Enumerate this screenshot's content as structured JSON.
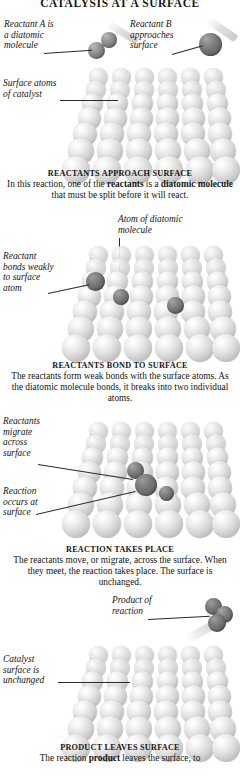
{
  "title": "CATALYSIS AT A SURFACE",
  "panels": [
    {
      "id": "approach",
      "labels": [
        {
          "name": "reactant-a-label",
          "text": "Reactant A is\na diatomic\nmolecule"
        },
        {
          "name": "reactant-b-label",
          "text": "Reactant B\napproaches\nsurface"
        },
        {
          "name": "surface-atoms-label",
          "text": "Surface atoms\nof catalyst"
        }
      ],
      "caption_heading": "REACTANTS APPROACH SURFACE",
      "caption_body_parts": [
        {
          "text": "In this reaction, one of the ",
          "bold": false
        },
        {
          "text": "reactants",
          "bold": true
        },
        {
          "text": " is a ",
          "bold": false
        },
        {
          "text": "diatomic molecule",
          "bold": true
        },
        {
          "text": " that must be split before it will react.",
          "bold": false
        }
      ]
    },
    {
      "id": "bond",
      "labels": [
        {
          "name": "reactant-bonds-weakly-label",
          "text": "Reactant\nbonds weakly\nto surface\natom"
        },
        {
          "name": "atom-of-diatomic-label",
          "text": "Atom of diatomic\nmolecule"
        }
      ],
      "caption_heading": "REACTANTS BOND TO SURFACE",
      "caption_body_parts": [
        {
          "text": "The reactants form weak bonds with the surface atoms. As the diatomic molecule bonds, it breaks into two individual atoms.",
          "bold": false
        }
      ]
    },
    {
      "id": "reaction",
      "labels": [
        {
          "name": "reactants-migrate-label",
          "text": "Reactants\nmigrate\nacross\nsurface"
        },
        {
          "name": "reaction-occurs-label",
          "text": "Reaction\noccurs at\nsurface"
        }
      ],
      "caption_heading": "REACTION TAKES PLACE",
      "caption_body_parts": [
        {
          "text": "The reactants move, or migrate, across the surface. When they meet, the reaction takes place. The surface is unchanged.",
          "bold": false
        }
      ]
    },
    {
      "id": "leaves",
      "labels": [
        {
          "name": "product-of-reaction-label",
          "text": "Product of\nreaction"
        },
        {
          "name": "catalyst-unchanged-label",
          "text": "Catalyst\nsurface is\nunchanged"
        }
      ],
      "caption_heading": "PRODUCT LEAVES SURFACE",
      "caption_body_parts": [
        {
          "text": "The reaction ",
          "bold": false
        },
        {
          "text": "product",
          "bold": true
        },
        {
          "text": " leaves the surface, to",
          "bold": false
        }
      ]
    }
  ],
  "colors": {
    "surface_atom": "#d6d6d6",
    "reactant_mid": "#909090",
    "reactant_dark": "#7d7d7d",
    "text": "#141414",
    "leader_line": "#2b2b2b",
    "background": "#ffffff"
  }
}
